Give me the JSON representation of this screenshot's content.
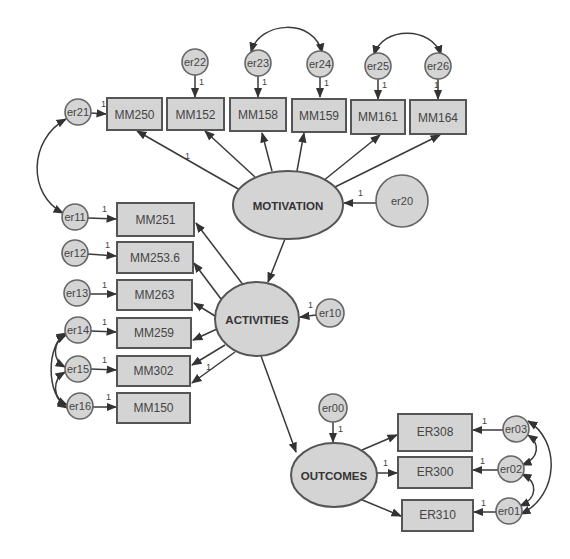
{
  "diagram": {
    "type": "structural-equation-model",
    "latents": {
      "motivation": "MOTIVATION",
      "activities": "ACTIVITIES",
      "outcomes": "OUTCOMES"
    },
    "motivation_indicators": [
      "MM250",
      "MM152",
      "MM158",
      "MM159",
      "MM161",
      "MM164"
    ],
    "motivation_errors": [
      "er21",
      "er22",
      "er23",
      "er24",
      "er25",
      "er26"
    ],
    "activities_indicators": [
      "MM251",
      "MM253.6",
      "MM263",
      "MM259",
      "MM302",
      "MM150"
    ],
    "activities_errors": [
      "er11",
      "er12",
      "er13",
      "er14",
      "er15",
      "er16"
    ],
    "outcomes_indicators": [
      "ER308",
      "ER300",
      "ER310"
    ],
    "outcomes_errors": [
      "er03",
      "er02",
      "er01"
    ],
    "disturbances": {
      "motivation": "er20",
      "activities": "er10",
      "outcomes": "er00"
    },
    "fixed_weight_label": "1",
    "structural_paths": [
      {
        "from": "MOTIVATION",
        "to": "ACTIVITIES"
      },
      {
        "from": "ACTIVITIES",
        "to": "OUTCOMES"
      }
    ],
    "covariances": [
      [
        "er23",
        "er24"
      ],
      [
        "er25",
        "er26"
      ],
      [
        "er21",
        "er11"
      ],
      [
        "er14",
        "er15"
      ],
      [
        "er15",
        "er16"
      ],
      [
        "er14",
        "er16"
      ],
      [
        "er03",
        "er02"
      ],
      [
        "er02",
        "er01"
      ],
      [
        "er03",
        "er01"
      ]
    ],
    "colors": {
      "node_fill": "#d4d4d4",
      "node_stroke": "#555555",
      "edge": "#3a3a3a",
      "background": "#ffffff"
    }
  }
}
